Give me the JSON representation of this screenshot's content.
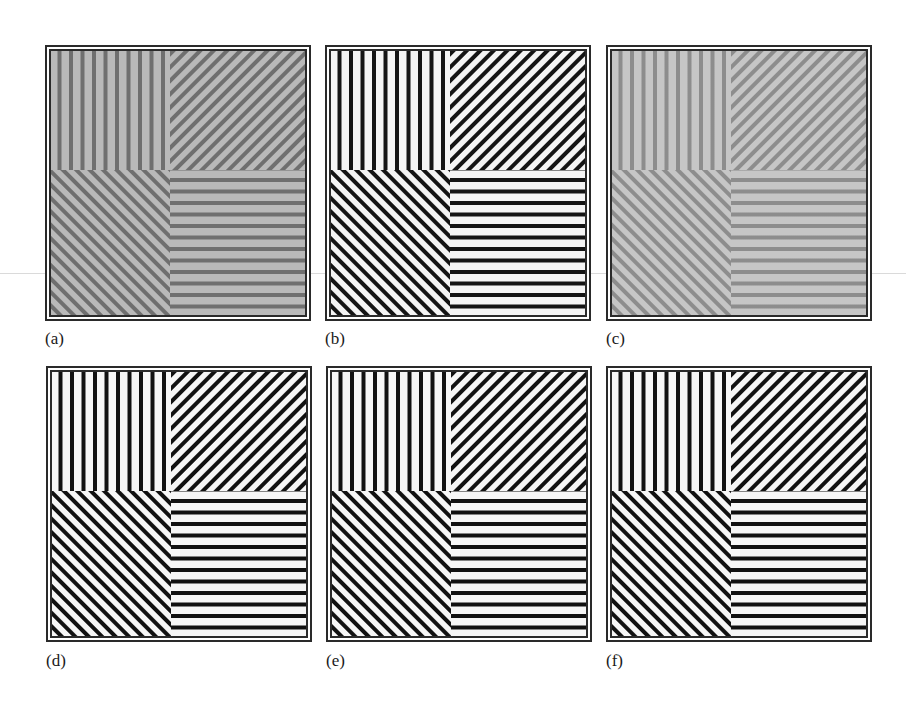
{
  "figure": {
    "background": "#ffffff",
    "scanline_y": 273,
    "panels": [
      {
        "id": "a",
        "label": "(a)",
        "x": 45,
        "y": 45,
        "label_y": 330,
        "contrast": "low",
        "light": "#b9b9b9",
        "dark": "#6f6f6f",
        "quadrants": {
          "top_left": "vertical",
          "top_right": "diagonal-up",
          "bottom_left": "diagonal-down",
          "bottom_right": "horizontal"
        }
      },
      {
        "id": "b",
        "label": "(b)",
        "x": 325,
        "y": 45,
        "label_y": 330,
        "contrast": "high",
        "light": "#f4f4f4",
        "dark": "#141414",
        "quadrants": {
          "top_left": "vertical",
          "top_right": "diagonal-up",
          "bottom_left": "diagonal-down",
          "bottom_right": "horizontal"
        }
      },
      {
        "id": "c",
        "label": "(c)",
        "x": 606,
        "y": 45,
        "label_y": 330,
        "contrast": "very-low",
        "light": "#c6c6c6",
        "dark": "#8d8d8d",
        "quadrants": {
          "top_left": "vertical",
          "top_right": "diagonal-up",
          "bottom_left": "diagonal-down",
          "bottom_right": "horizontal"
        }
      },
      {
        "id": "d",
        "label": "(d)",
        "x": 46,
        "y": 366,
        "label_y": 652,
        "contrast": "high",
        "light": "#f6f6f6",
        "dark": "#111111",
        "quadrants": {
          "top_left": "vertical",
          "top_right": "diagonal-up",
          "bottom_left": "diagonal-down",
          "bottom_right": "horizontal"
        }
      },
      {
        "id": "e",
        "label": "(e)",
        "x": 326,
        "y": 366,
        "label_y": 652,
        "contrast": "high",
        "light": "#f6f6f6",
        "dark": "#111111",
        "quadrants": {
          "top_left": "vertical",
          "top_right": "diagonal-up",
          "bottom_left": "diagonal-down",
          "bottom_right": "horizontal"
        }
      },
      {
        "id": "f",
        "label": "(f)",
        "x": 606,
        "y": 366,
        "label_y": 652,
        "contrast": "high",
        "light": "#f6f6f6",
        "dark": "#111111",
        "quadrants": {
          "top_left": "vertical",
          "top_right": "diagonal-up",
          "bottom_left": "diagonal-down",
          "bottom_right": "horizontal"
        }
      }
    ]
  }
}
